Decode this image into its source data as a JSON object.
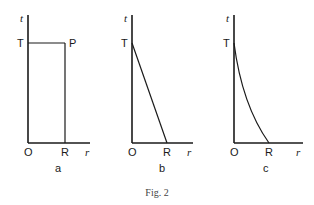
{
  "figure": {
    "caption": "Fig. 2",
    "panels": [
      {
        "id": "a",
        "label": "a",
        "axis_labels": {
          "y": "t",
          "x": "r"
        },
        "points": {
          "origin": "O",
          "top": "T",
          "corner": "P",
          "right": "R"
        },
        "shape": "rectangle O-T-P-R"
      },
      {
        "id": "b",
        "label": "b",
        "axis_labels": {
          "y": "t",
          "x": "r"
        },
        "points": {
          "origin": "O",
          "top": "T",
          "right": "R"
        },
        "shape": "straight line from T to R"
      },
      {
        "id": "c",
        "label": "c",
        "axis_labels": {
          "y": "t",
          "x": "r"
        },
        "points": {
          "origin": "O",
          "top": "T",
          "right": "R"
        },
        "shape": "concave curve from T to R"
      }
    ]
  }
}
